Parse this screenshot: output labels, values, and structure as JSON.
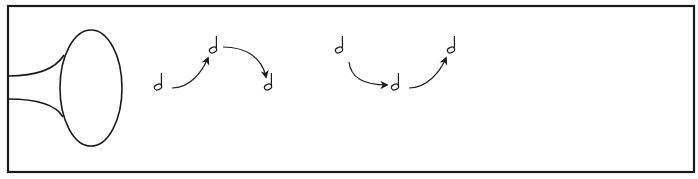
{
  "diagram": {
    "colors": {
      "stroke": "#1a1a1a",
      "background": "#ffffff"
    },
    "source_icon": "horn-bell-icon",
    "note_glyph": "half-note",
    "groups": [
      {
        "name": "rise-then-fall",
        "notes": [
          {
            "pitch": "low"
          },
          {
            "pitch": "high"
          },
          {
            "pitch": "low"
          }
        ],
        "arrows": [
          {
            "from": 0,
            "to": 1,
            "direction": "up"
          },
          {
            "from": 1,
            "to": 2,
            "direction": "down"
          }
        ]
      },
      {
        "name": "fall-then-rise",
        "notes": [
          {
            "pitch": "high"
          },
          {
            "pitch": "low"
          },
          {
            "pitch": "high"
          }
        ],
        "arrows": [
          {
            "from": 0,
            "to": 1,
            "direction": "down"
          },
          {
            "from": 1,
            "to": 2,
            "direction": "up"
          }
        ]
      }
    ]
  }
}
